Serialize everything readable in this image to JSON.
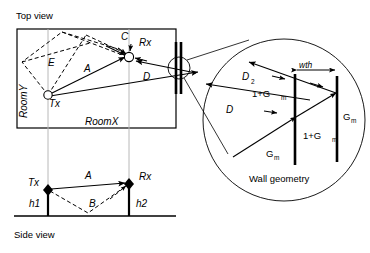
{
  "figure": {
    "title_top": "Top view",
    "title_side": "Side view",
    "title_inset": "Wall geometry"
  },
  "top_view": {
    "label_room_x": "RoomX",
    "label_room_y": "RoomY",
    "node_tx": "Tx",
    "node_rx": "Rx",
    "ray_a": "A",
    "ray_c": "C",
    "ray_d": "D",
    "ray_e": "E"
  },
  "side_view": {
    "node_tx": "Tx",
    "node_rx": "Rx",
    "ray_a": "A",
    "ray_b": "B",
    "height_1": "h1",
    "height_2": "h2"
  },
  "wall_inset": {
    "caption": "Wall geometry",
    "label_thickness": "wth",
    "label_d": "D",
    "label_d2": "D",
    "label_d2_sub": "2",
    "gain_base": "G",
    "gain_sub": "m",
    "gain_plus_base": "1+G",
    "gain_plus_sub": "m",
    "labels_in_order": [
      "D",
      "D2",
      "1+G m",
      "1+G m",
      "G m",
      "G m",
      "wth"
    ]
  },
  "colors": {
    "ink": "#000000",
    "paper": "#ffffff",
    "guide": "#b8b8b8"
  }
}
